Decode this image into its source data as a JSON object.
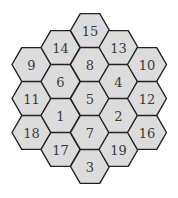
{
  "diagram": {
    "type": "hexagonal-grid",
    "orientation": "flat-top",
    "colors": {
      "fill": "#dcdcdc",
      "stroke": "#222222",
      "text": "#3a3a3a",
      "background": "#ffffff"
    },
    "hex_radius": 19.5,
    "cells": [
      {
        "label": "9",
        "cx": 31.5,
        "cy": 64.5
      },
      {
        "label": "11",
        "cx": 31.5,
        "cy": 98.5
      },
      {
        "label": "18",
        "cx": 31.5,
        "cy": 132.5
      },
      {
        "label": "14",
        "cx": 60.5,
        "cy": 47.5
      },
      {
        "label": "6",
        "cx": 60.5,
        "cy": 81.5
      },
      {
        "label": "1",
        "cx": 60.5,
        "cy": 115.5
      },
      {
        "label": "17",
        "cx": 60.5,
        "cy": 149.5
      },
      {
        "label": "15",
        "cx": 90,
        "cy": 30.5
      },
      {
        "label": "8",
        "cx": 90,
        "cy": 64.5
      },
      {
        "label": "5",
        "cx": 90,
        "cy": 98.5
      },
      {
        "label": "7",
        "cx": 90,
        "cy": 132.5
      },
      {
        "label": "3",
        "cx": 90,
        "cy": 166.5
      },
      {
        "label": "13",
        "cx": 118.5,
        "cy": 47.5
      },
      {
        "label": "4",
        "cx": 118.5,
        "cy": 81.5
      },
      {
        "label": "2",
        "cx": 118.5,
        "cy": 115.5
      },
      {
        "label": "19",
        "cx": 118.5,
        "cy": 149.5
      },
      {
        "label": "10",
        "cx": 147,
        "cy": 64.5
      },
      {
        "label": "12",
        "cx": 147,
        "cy": 98.5
      },
      {
        "label": "16",
        "cx": 147,
        "cy": 132.5
      }
    ]
  }
}
